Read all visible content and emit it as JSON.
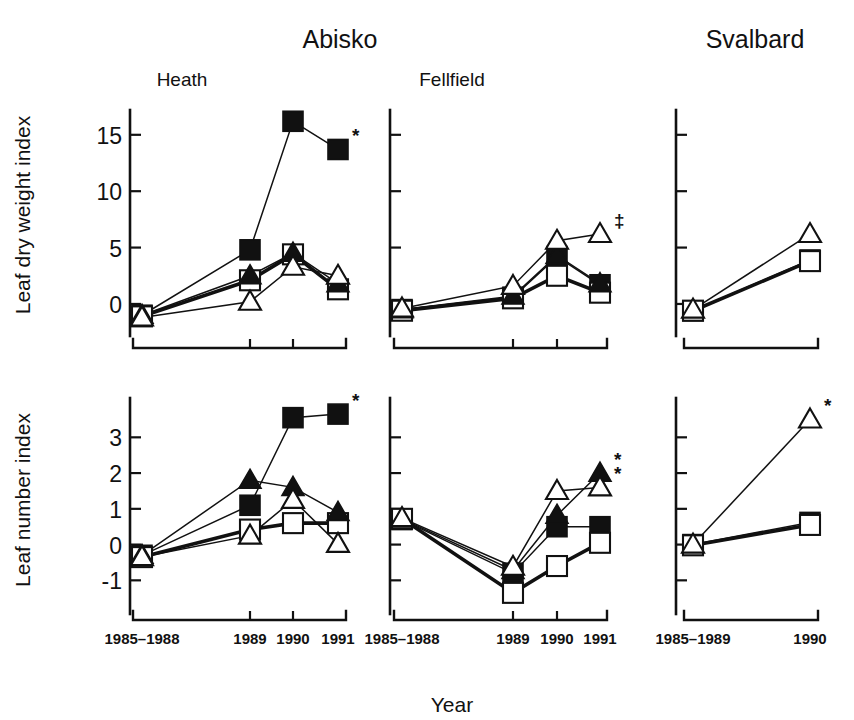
{
  "figure": {
    "width": 854,
    "height": 720,
    "background": "#ffffff",
    "ink_color": "#111111",
    "regions": [
      {
        "key": "abisko",
        "label": "Abisko"
      },
      {
        "key": "svalbard",
        "label": "Svalbard"
      }
    ],
    "xaxis_title": "Year",
    "row_titles": [
      "Leaf dry weight index",
      "Leaf number index"
    ]
  },
  "legend_symbols": {
    "filled_square": "filled-square",
    "open_square": "open-square",
    "filled_triangle": "filled-triangle",
    "open_triangle": "open-triangle"
  },
  "chart_data": [
    {
      "id": "heath-dry-weight",
      "type": "line",
      "title": "Heath",
      "region": "Abisko",
      "xlabel": "Year",
      "ylabel": "Leaf dry weight index",
      "categories": [
        "1985–1988",
        "1989",
        "1990",
        "1991"
      ],
      "yticks": [
        0,
        5,
        10,
        15
      ],
      "ylim": [
        -1.6,
        17.2
      ],
      "grid": false,
      "legend_position": "none",
      "series": [
        {
          "name": "filled-square",
          "marker": "filled-square",
          "line": "thin",
          "values": [
            -1.0,
            4.8,
            16.2,
            13.7
          ],
          "annotation": "*"
        },
        {
          "name": "open-square",
          "marker": "open-square",
          "line": "thick",
          "values": [
            -1.1,
            2.1,
            4.4,
            1.3
          ],
          "annotation": ""
        },
        {
          "name": "filled-triangle",
          "marker": "filled-triangle",
          "line": "thin",
          "values": [
            -1.0,
            2.5,
            4.5,
            1.8
          ],
          "annotation": ""
        },
        {
          "name": "open-triangle",
          "marker": "open-triangle",
          "line": "thin",
          "values": [
            -1.2,
            0.2,
            3.3,
            2.5
          ],
          "annotation": ""
        }
      ]
    },
    {
      "id": "fellfield-dry-weight",
      "type": "line",
      "title": "Fellfield",
      "region": "Abisko",
      "xlabel": "Year",
      "ylabel": "Leaf dry weight index",
      "categories": [
        "1985–1988",
        "1989",
        "1990",
        "1991"
      ],
      "yticks": [
        0,
        5,
        10,
        15
      ],
      "ylim": [
        -1.6,
        17.2
      ],
      "grid": false,
      "legend_position": "none",
      "series": [
        {
          "name": "filled-square",
          "marker": "filled-square",
          "line": "thin",
          "values": [
            -0.5,
            0.6,
            4.2,
            1.7
          ],
          "annotation": ""
        },
        {
          "name": "open-square",
          "marker": "open-square",
          "line": "thick",
          "values": [
            -0.6,
            0.5,
            2.5,
            1.0
          ],
          "annotation": ""
        },
        {
          "name": "filled-triangle",
          "marker": "filled-triangle",
          "line": "thin",
          "values": [
            -0.5,
            0.7,
            4.3,
            1.8
          ],
          "annotation": ""
        },
        {
          "name": "open-triangle",
          "marker": "open-triangle",
          "line": "thin",
          "values": [
            -0.4,
            1.6,
            5.6,
            6.2
          ],
          "annotation": "‡"
        }
      ]
    },
    {
      "id": "svalbard-dry-weight",
      "type": "line",
      "title": "",
      "region": "Svalbard",
      "xlabel": "Year",
      "ylabel": "Leaf dry weight index",
      "categories": [
        "1985–1989",
        "1990"
      ],
      "yticks": [
        0,
        5,
        10,
        15
      ],
      "ylim": [
        -1.6,
        17.2
      ],
      "grid": false,
      "legend_position": "none",
      "series": [
        {
          "name": "filled-square",
          "marker": "filled-square",
          "line": "thin",
          "values": [
            -0.6,
            3.9
          ],
          "annotation": ""
        },
        {
          "name": "open-square",
          "marker": "open-square",
          "line": "thick",
          "values": [
            -0.6,
            3.8
          ],
          "annotation": ""
        },
        {
          "name": "open-triangle",
          "marker": "open-triangle",
          "line": "thin",
          "values": [
            -0.5,
            6.2
          ],
          "annotation": ""
        }
      ]
    },
    {
      "id": "heath-leaf-number",
      "type": "line",
      "title": "",
      "region": "Abisko",
      "xlabel": "Year",
      "ylabel": "Leaf number index",
      "categories": [
        "1985–1988",
        "1989",
        "1990",
        "1991"
      ],
      "yticks": [
        -1,
        0,
        1,
        2,
        3
      ],
      "ylim": [
        -1.55,
        4.1
      ],
      "grid": false,
      "legend_position": "none",
      "series": [
        {
          "name": "filled-square",
          "marker": "filled-square",
          "line": "thin",
          "values": [
            -0.3,
            1.1,
            3.55,
            3.65
          ],
          "annotation": "*"
        },
        {
          "name": "open-square",
          "marker": "open-square",
          "line": "thick",
          "values": [
            -0.35,
            0.42,
            0.6,
            0.6
          ],
          "annotation": ""
        },
        {
          "name": "filled-triangle",
          "marker": "filled-triangle",
          "line": "thin",
          "values": [
            -0.3,
            1.8,
            1.6,
            0.9
          ],
          "annotation": ""
        },
        {
          "name": "open-triangle",
          "marker": "open-triangle",
          "line": "thin",
          "values": [
            -0.35,
            0.25,
            1.25,
            0.02
          ],
          "annotation": ""
        }
      ]
    },
    {
      "id": "fellfield-leaf-number",
      "type": "line",
      "title": "",
      "region": "Abisko",
      "xlabel": "Year",
      "ylabel": "Leaf number index",
      "categories": [
        "1985–1988",
        "1989",
        "1990",
        "1991"
      ],
      "yticks": [
        -1,
        0,
        1,
        2,
        3
      ],
      "ylim": [
        -1.55,
        4.1
      ],
      "grid": false,
      "legend_position": "none",
      "series": [
        {
          "name": "filled-square",
          "marker": "filled-square",
          "line": "thin",
          "values": [
            0.7,
            -0.8,
            0.5,
            0.5
          ],
          "annotation": ""
        },
        {
          "name": "open-square",
          "marker": "open-square",
          "line": "thick",
          "values": [
            0.72,
            -1.35,
            -0.6,
            0.05
          ],
          "annotation": ""
        },
        {
          "name": "filled-triangle",
          "marker": "filled-triangle",
          "line": "thin",
          "values": [
            0.72,
            -0.72,
            0.82,
            2.0
          ],
          "annotation": "*"
        },
        {
          "name": "open-triangle",
          "marker": "open-triangle",
          "line": "thin",
          "values": [
            0.74,
            -0.62,
            1.5,
            1.6
          ],
          "annotation": "*"
        }
      ]
    },
    {
      "id": "svalbard-leaf-number",
      "type": "line",
      "title": "",
      "region": "Svalbard",
      "xlabel": "Year",
      "ylabel": "Leaf number index",
      "categories": [
        "1985–1989",
        "1990"
      ],
      "yticks": [
        -1,
        0,
        1,
        2,
        3
      ],
      "ylim": [
        -1.55,
        4.1
      ],
      "grid": false,
      "legend_position": "none",
      "series": [
        {
          "name": "filled-square",
          "marker": "filled-square",
          "line": "thin",
          "values": [
            0.0,
            0.62
          ],
          "annotation": ""
        },
        {
          "name": "open-square",
          "marker": "open-square",
          "line": "thick",
          "values": [
            -0.02,
            0.55
          ],
          "annotation": ""
        },
        {
          "name": "open-triangle",
          "marker": "open-triangle",
          "line": "thin",
          "values": [
            0.0,
            3.5
          ],
          "annotation": "*"
        }
      ]
    }
  ]
}
